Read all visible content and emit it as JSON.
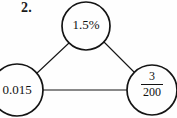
{
  "item": {
    "number_label": "2."
  },
  "diagram": {
    "type": "equivalence-triangle",
    "stroke_color": "#141414",
    "background_color": "#fefefe",
    "nodes": [
      {
        "id": "top",
        "shape": "circle",
        "value_text": "1.5%",
        "cx": 86,
        "cy": 26,
        "r": 24
      },
      {
        "id": "bottom-left",
        "shape": "circle",
        "value_text": "0.015",
        "cx": 17,
        "cy": 90,
        "r": 26
      },
      {
        "id": "bottom-right",
        "shape": "circle",
        "fraction_numerator": "3",
        "fraction_denominator": "200",
        "cx": 152,
        "cy": 90,
        "r": 25
      }
    ],
    "edges": [
      {
        "from": "top",
        "to": "bottom-left"
      },
      {
        "from": "top",
        "to": "bottom-right"
      },
      {
        "from": "bottom-left",
        "to": "bottom-right"
      }
    ]
  }
}
